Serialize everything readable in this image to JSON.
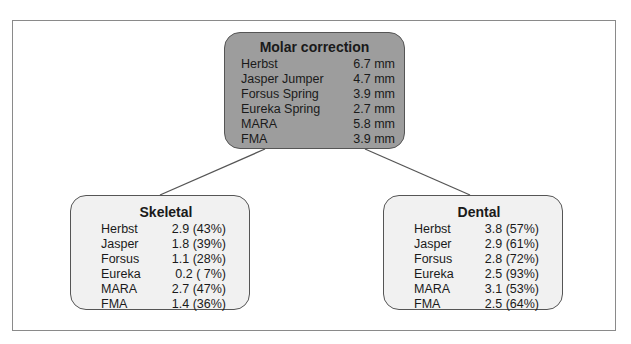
{
  "diagram": {
    "root": {
      "title": "Molar correction",
      "rows": [
        {
          "label": "Herbst",
          "value": "6.7 mm"
        },
        {
          "label": "Jasper Jumper",
          "value": "4.7 mm"
        },
        {
          "label": "Forsus Spring",
          "value": "3.9 mm"
        },
        {
          "label": "Eureka Spring",
          "value": "2.7 mm"
        },
        {
          "label": "MARA",
          "value": "5.8 mm"
        },
        {
          "label": "FMA",
          "value": "3.9 mm"
        }
      ]
    },
    "skeletal": {
      "title": "Skeletal",
      "rows": [
        {
          "label": "Herbst",
          "value": "2.9 (43%)"
        },
        {
          "label": "Jasper",
          "value": "1.8 (39%)"
        },
        {
          "label": "Forsus",
          "value": "1.1 (28%)"
        },
        {
          "label": "Eureka",
          "value": "0.2 ( 7%)"
        },
        {
          "label": "MARA",
          "value": "2.7 (47%)"
        },
        {
          "label": "FMA",
          "value": "1.4 (36%)"
        }
      ]
    },
    "dental": {
      "title": "Dental",
      "rows": [
        {
          "label": "Herbst",
          "value": "3.8 (57%)"
        },
        {
          "label": "Jasper",
          "value": "2.9 (61%)"
        },
        {
          "label": "Forsus",
          "value": "2.8 (72%)"
        },
        {
          "label": "Eureka",
          "value": "2.5 (93%)"
        },
        {
          "label": "MARA",
          "value": "3.1 (53%)"
        },
        {
          "label": "FMA",
          "value": "2.5 (64%)"
        }
      ]
    },
    "colors": {
      "root_fill": "#9d9d9d",
      "child_fill": "#f1f1f1",
      "border": "#555555",
      "connector": "#555555"
    }
  }
}
